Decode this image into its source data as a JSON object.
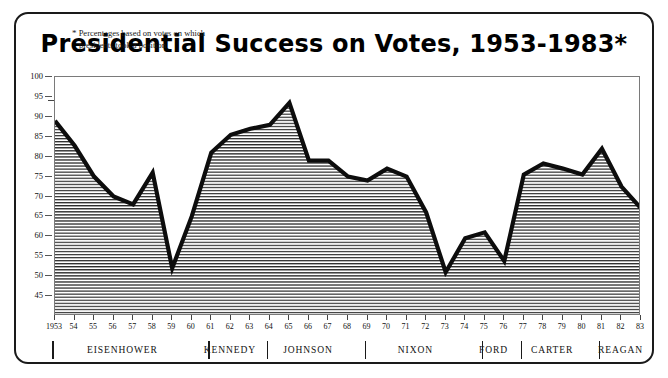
{
  "figure": {
    "title": "Presidential Success on Votes, 1953-1983*",
    "annotation_line1": "Percentages based on votes on which",
    "annotation_line2": "presidents took a position",
    "annotation_marker": "*"
  },
  "axes": {
    "y_ticks": [
      100,
      95,
      90,
      85,
      80,
      75,
      70,
      65,
      60,
      55,
      50,
      45
    ],
    "y_min": 40,
    "y_max": 100,
    "x_first_label": "1953",
    "x_labels": [
      "1953",
      "54",
      "55",
      "56",
      "57",
      "58",
      "59",
      "60",
      "61",
      "62",
      "63",
      "64",
      "65",
      "66",
      "67",
      "68",
      "69",
      "70",
      "71",
      "72",
      "73",
      "74",
      "75",
      "76",
      "77",
      "78",
      "79",
      "80",
      "81",
      "82",
      "83"
    ]
  },
  "presidents": [
    {
      "name": "EISENHOWER",
      "start_year": 1953,
      "end_year": 1960
    },
    {
      "name": "KENNEDY",
      "start_year": 1961,
      "end_year": 1963
    },
    {
      "name": "JOHNSON",
      "start_year": 1964,
      "end_year": 1968
    },
    {
      "name": "NIXON",
      "start_year": 1969,
      "end_year": 1974
    },
    {
      "name": "FORD",
      "start_year": 1975,
      "end_year": 1976
    },
    {
      "name": "CARTER",
      "start_year": 1977,
      "end_year": 1980
    },
    {
      "name": "REAGAN",
      "start_year": 1981,
      "end_year": 1983
    }
  ],
  "colors": {
    "line": "#0d0d0d",
    "fill_hatch": "#2b2b2b",
    "frame": "#1a1a1a",
    "axis": "#6e6e6e"
  },
  "chart_data": {
    "type": "line",
    "title": "Presidential Success on Votes, 1953-1983*",
    "xlabel": "",
    "ylabel": "",
    "ylim": [
      40,
      100
    ],
    "xlim": [
      1953,
      1983
    ],
    "grid": false,
    "legend": "none",
    "annotations": [
      "* Percentages based on votes on which presidents took a position"
    ],
    "x": [
      1953,
      1954,
      1955,
      1956,
      1957,
      1958,
      1959,
      1960,
      1961,
      1962,
      1963,
      1964,
      1965,
      1966,
      1967,
      1968,
      1969,
      1970,
      1971,
      1972,
      1973,
      1974,
      1975,
      1976,
      1977,
      1978,
      1979,
      1980,
      1981,
      1982,
      1983
    ],
    "series": [
      {
        "name": "Presidential success rate on votes (%)",
        "values": [
          89.0,
          82.8,
          75.0,
          70.0,
          68.0,
          76.0,
          52.0,
          65.0,
          81.0,
          85.5,
          87.0,
          88.0,
          93.5,
          79.0,
          79.0,
          75.0,
          74.0,
          77.0,
          75.0,
          66.0,
          51.0,
          59.5,
          61.0,
          53.8,
          75.5,
          78.3,
          77.0,
          75.5,
          82.0,
          72.5,
          67.0
        ]
      }
    ]
  }
}
